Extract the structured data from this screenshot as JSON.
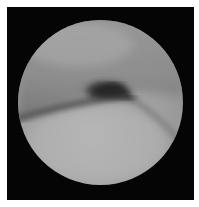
{
  "image": {
    "type": "endoscopic view",
    "description": "Grayscale circular endoscopic field of view on black background with white border, showing a dark crease/fold across the upper middle region.",
    "colors": {
      "border": "#ffffff",
      "background": "#050505",
      "tissue_light": "#b4b4b4",
      "tissue_mid": "#8f8f8f",
      "shadow": "#2a2a2a"
    }
  }
}
